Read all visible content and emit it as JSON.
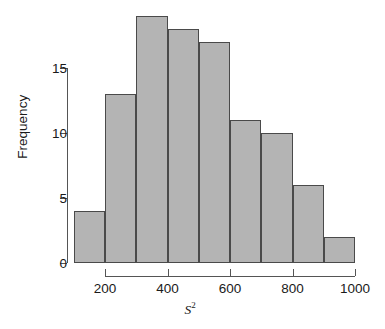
{
  "chart_data": {
    "type": "bar",
    "title": "",
    "subtitle": "",
    "xlabel": "S2",
    "xlabel_base": "S",
    "xlabel_exponent": "2",
    "ylabel": "Frequency",
    "categories": [
      "100-200",
      "200-300",
      "300-400",
      "400-500",
      "500-600",
      "600-700",
      "700-800",
      "800-900",
      "900-1000"
    ],
    "bin_edges": [
      100,
      200,
      300,
      400,
      500,
      600,
      700,
      800,
      900,
      1000
    ],
    "values": [
      4,
      13,
      19,
      18,
      17,
      11,
      10,
      6,
      2
    ],
    "bin_width": 100,
    "xlim": [
      100,
      1000
    ],
    "ylim": [
      0,
      19.5
    ],
    "x_ticks": [
      200,
      400,
      600,
      800,
      1000
    ],
    "x_tick_labels": [
      "200",
      "400",
      "600",
      "800",
      "1000"
    ],
    "y_ticks": [
      0,
      5,
      10,
      15
    ],
    "y_tick_labels": [
      "0",
      "5",
      "10",
      "15"
    ],
    "grid": false,
    "legend": null,
    "legend_position": "none",
    "colors": {
      "bar_fill": "#b4b4b4",
      "bar_border": "#4a4a4a",
      "axis": "#555555",
      "text": "#1a1a1a",
      "background": "#ffffff"
    }
  }
}
